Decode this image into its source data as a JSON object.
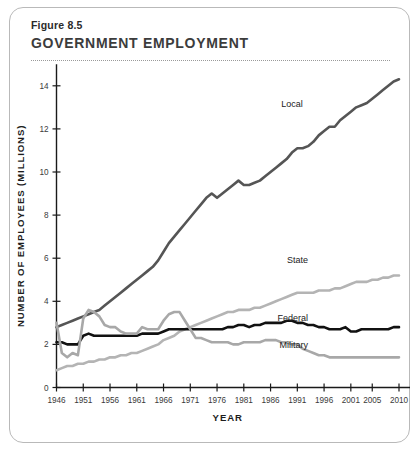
{
  "figure": {
    "number": "Figure 8.5",
    "title": "GOVERNMENT EMPLOYMENT"
  },
  "chart_data": {
    "type": "line",
    "title": "GOVERNMENT EMPLOYMENT",
    "subtitle": "Figure 8.5",
    "xlabel": "YEAR",
    "ylabel": "NUMBER OF EMPLOYEES (MILLIONS)",
    "xlim": [
      1946,
      2010
    ],
    "ylim": [
      0,
      15
    ],
    "grid": false,
    "legend_position": "inline-right-of-line",
    "x_ticks": [
      1946,
      1951,
      1956,
      1961,
      1966,
      1971,
      1976,
      1981,
      1986,
      1991,
      1996,
      2001,
      2005,
      2010
    ],
    "y_ticks": [
      0,
      2,
      4,
      6,
      8,
      10,
      12,
      14
    ],
    "x": [
      1946,
      1947,
      1948,
      1949,
      1950,
      1951,
      1952,
      1953,
      1954,
      1955,
      1956,
      1957,
      1958,
      1959,
      1960,
      1961,
      1962,
      1963,
      1964,
      1965,
      1966,
      1967,
      1968,
      1969,
      1970,
      1971,
      1972,
      1973,
      1974,
      1975,
      1976,
      1977,
      1978,
      1979,
      1980,
      1981,
      1982,
      1983,
      1984,
      1985,
      1986,
      1987,
      1988,
      1989,
      1990,
      1991,
      1992,
      1993,
      1994,
      1995,
      1996,
      1997,
      1998,
      1999,
      2000,
      2001,
      2002,
      2003,
      2004,
      2005,
      2006,
      2007,
      2008,
      2009,
      2010
    ],
    "series": [
      {
        "name": "Local",
        "color": "#555555",
        "stroke_width": 2.6,
        "label_x": 1992,
        "label_y": 13.0,
        "values": [
          2.8,
          2.9,
          3.0,
          3.1,
          3.2,
          3.3,
          3.4,
          3.5,
          3.6,
          3.8,
          4.0,
          4.2,
          4.4,
          4.6,
          4.8,
          5.0,
          5.2,
          5.4,
          5.6,
          5.9,
          6.3,
          6.7,
          7.0,
          7.3,
          7.6,
          7.9,
          8.2,
          8.5,
          8.8,
          9.0,
          8.8,
          9.0,
          9.2,
          9.4,
          9.6,
          9.4,
          9.4,
          9.5,
          9.6,
          9.8,
          10.0,
          10.2,
          10.4,
          10.6,
          10.9,
          11.1,
          11.1,
          11.2,
          11.4,
          11.7,
          11.9,
          12.1,
          12.1,
          12.4,
          12.6,
          12.8,
          13.0,
          13.1,
          13.2,
          13.4,
          13.6,
          13.8,
          14.0,
          14.2,
          14.3
        ]
      },
      {
        "name": "State",
        "color": "#b4b4b4",
        "stroke_width": 2.6,
        "label_x": 1993,
        "label_y": 5.8,
        "values": [
          0.8,
          0.9,
          1.0,
          1.0,
          1.1,
          1.1,
          1.2,
          1.2,
          1.3,
          1.3,
          1.4,
          1.4,
          1.5,
          1.5,
          1.6,
          1.6,
          1.7,
          1.8,
          1.9,
          2.0,
          2.2,
          2.3,
          2.4,
          2.6,
          2.7,
          2.8,
          2.9,
          3.0,
          3.1,
          3.2,
          3.3,
          3.4,
          3.5,
          3.5,
          3.6,
          3.6,
          3.6,
          3.7,
          3.7,
          3.8,
          3.9,
          4.0,
          4.1,
          4.2,
          4.3,
          4.4,
          4.4,
          4.4,
          4.4,
          4.5,
          4.5,
          4.5,
          4.6,
          4.6,
          4.7,
          4.8,
          4.9,
          4.9,
          4.9,
          5.0,
          5.0,
          5.1,
          5.1,
          5.2,
          5.2
        ]
      },
      {
        "name": "Federal",
        "color": "#111111",
        "stroke_width": 2.6,
        "label_x": 1993,
        "label_y": 3.1,
        "values": [
          2.1,
          2.1,
          2.0,
          2.0,
          2.0,
          2.4,
          2.5,
          2.4,
          2.4,
          2.4,
          2.4,
          2.4,
          2.4,
          2.4,
          2.4,
          2.4,
          2.5,
          2.5,
          2.5,
          2.5,
          2.6,
          2.7,
          2.7,
          2.7,
          2.7,
          2.7,
          2.7,
          2.7,
          2.7,
          2.7,
          2.7,
          2.7,
          2.8,
          2.8,
          2.9,
          2.9,
          2.8,
          2.9,
          2.9,
          3.0,
          3.0,
          3.0,
          3.0,
          3.1,
          3.1,
          3.0,
          3.0,
          2.9,
          2.9,
          2.8,
          2.8,
          2.7,
          2.7,
          2.7,
          2.8,
          2.6,
          2.6,
          2.7,
          2.7,
          2.7,
          2.7,
          2.7,
          2.7,
          2.8,
          2.8
        ]
      },
      {
        "name": "Military",
        "color": "#a8a8a8",
        "stroke_width": 2.6,
        "label_x": 1993,
        "label_y": 1.85,
        "values": [
          3.0,
          1.6,
          1.4,
          1.6,
          1.5,
          3.2,
          3.6,
          3.5,
          3.3,
          2.9,
          2.8,
          2.8,
          2.6,
          2.5,
          2.5,
          2.5,
          2.8,
          2.7,
          2.7,
          2.7,
          3.1,
          3.4,
          3.5,
          3.5,
          3.1,
          2.7,
          2.3,
          2.3,
          2.2,
          2.1,
          2.1,
          2.1,
          2.1,
          2.0,
          2.0,
          2.1,
          2.1,
          2.1,
          2.1,
          2.2,
          2.2,
          2.2,
          2.1,
          2.1,
          2.0,
          2.0,
          1.8,
          1.7,
          1.6,
          1.5,
          1.5,
          1.4,
          1.4,
          1.4,
          1.4,
          1.4,
          1.4,
          1.4,
          1.4,
          1.4,
          1.4,
          1.4,
          1.4,
          1.4,
          1.4
        ]
      }
    ]
  }
}
